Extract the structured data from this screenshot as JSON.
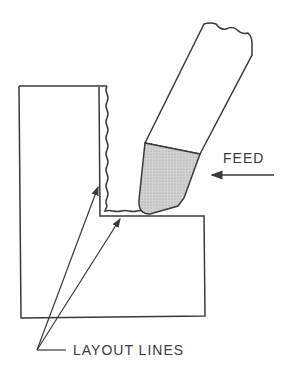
{
  "diagram": {
    "type": "technical-illustration",
    "labels": {
      "feed": "FEED",
      "layout_lines": "LAYOUT LINES"
    },
    "colors": {
      "line": "#3a3a3a",
      "tool_tip_fill": "#c8c8c8",
      "background": "#ffffff"
    }
  }
}
